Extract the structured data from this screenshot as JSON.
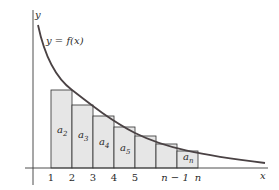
{
  "diagram": {
    "axis_labels": {
      "x": "x",
      "y": "y"
    },
    "curve_label": "y = f(x)",
    "curve_color": "#4a4244",
    "rect_fill": "#e6e6e6",
    "ticks": [
      {
        "label": "1",
        "x": 51
      },
      {
        "label": "2",
        "x": 72
      },
      {
        "label": "3",
        "x": 93
      },
      {
        "label": "4",
        "x": 114
      },
      {
        "label": "5",
        "x": 135
      },
      {
        "label": "n − 1",
        "x": 177
      },
      {
        "label": "n",
        "x": 198
      }
    ],
    "rectangles": [
      {
        "x0": 51,
        "x1": 72,
        "top": 90,
        "label_base": "a",
        "label_sub": "2"
      },
      {
        "x0": 72,
        "x1": 93,
        "top": 105,
        "label_base": "a",
        "label_sub": "3"
      },
      {
        "x0": 93,
        "x1": 114,
        "top": 116,
        "label_base": "a",
        "label_sub": "4"
      },
      {
        "x0": 114,
        "x1": 135,
        "top": 127,
        "label_base": "a",
        "label_sub": "5"
      },
      {
        "x0": 135,
        "x1": 156,
        "top": 136,
        "label_base": "",
        "label_sub": ""
      },
      {
        "x0": 156,
        "x1": 177,
        "top": 144,
        "label_base": "",
        "label_sub": ""
      },
      {
        "x0": 177,
        "x1": 198,
        "top": 151,
        "label_base": "a",
        "label_sub": "n"
      }
    ]
  }
}
